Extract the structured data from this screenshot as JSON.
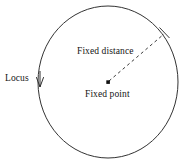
{
  "diagram": {
    "type": "geometry-circle-locus",
    "background_color": "#ffffff",
    "stroke_color": "#333333",
    "text_color": "#141414",
    "labels": {
      "locus": "Locus",
      "fixed_distance": "Fixed distance",
      "fixed_point": "Fixed point"
    },
    "shapes": {
      "circle": {
        "name": "locus-circle",
        "center_x": 108,
        "center_y": 82,
        "radius_x": 70,
        "radius_y": 76,
        "stroke_width": 1,
        "fill": "none"
      },
      "center_point": {
        "name": "fixed-point-dot",
        "x": 108,
        "y": 82,
        "size": 3.4
      },
      "radius_line": {
        "name": "fixed-distance-dashed-line",
        "x1": 109,
        "y1": 81,
        "x2": 165,
        "y2": 33,
        "dash": "3 3",
        "stroke_width": 1
      },
      "radius_end_tick": {
        "name": "radius-endpoint-tick",
        "x1": 159,
        "y1": 27,
        "x2": 170,
        "y2": 38
      },
      "locus_arrow": {
        "name": "locus-pointer-arrow",
        "x1": 40,
        "y1": 72,
        "x2": 40,
        "y2": 86
      }
    }
  }
}
